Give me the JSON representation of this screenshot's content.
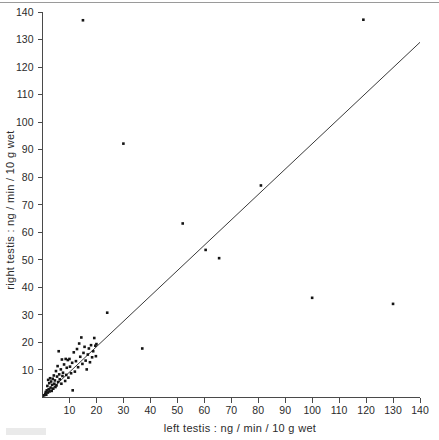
{
  "chart_data": {
    "type": "scatter",
    "title": "",
    "xlabel": "left testis : ng / min / 10 g wet",
    "ylabel": "right testis : ng / min / 10 g wet",
    "xlim": [
      0,
      140
    ],
    "ylim": [
      0,
      140
    ],
    "xticks": [
      10,
      20,
      30,
      40,
      50,
      60,
      70,
      80,
      90,
      100,
      110,
      120,
      130,
      140
    ],
    "yticks": [
      10,
      20,
      30,
      40,
      50,
      60,
      70,
      80,
      90,
      100,
      110,
      120,
      130,
      140
    ],
    "xtick_labels": [
      "10",
      "20",
      "30",
      "40",
      "50",
      "60",
      "70",
      "80",
      "90",
      "100",
      "110",
      "120",
      "130",
      "140"
    ],
    "ytick_labels": [
      "10",
      "20",
      "30",
      "40",
      "50",
      "60",
      "70",
      "80",
      "90",
      "100",
      "110",
      "120",
      "130",
      "140"
    ],
    "grid": false,
    "legend": null,
    "marker": "filled-square",
    "point_color": "#141414",
    "line_color": "#3a3a3a",
    "reference_line": {
      "label": "identity line",
      "x": [
        0,
        140
      ],
      "y": [
        0,
        129
      ]
    },
    "points": [
      [
        0.6,
        0.8
      ],
      [
        1.0,
        1.3
      ],
      [
        1.2,
        2.0
      ],
      [
        1.4,
        1.0
      ],
      [
        1.6,
        2.6
      ],
      [
        1.8,
        4.2
      ],
      [
        2.0,
        1.8
      ],
      [
        2.1,
        6.4
      ],
      [
        2.3,
        3.0
      ],
      [
        2.5,
        5.2
      ],
      [
        2.6,
        2.2
      ],
      [
        2.8,
        7.0
      ],
      [
        3.0,
        3.6
      ],
      [
        3.2,
        5.8
      ],
      [
        3.4,
        2.4
      ],
      [
        3.6,
        4.6
      ],
      [
        3.8,
        6.8
      ],
      [
        4.0,
        3.2
      ],
      [
        4.2,
        8.0
      ],
      [
        4.4,
        5.0
      ],
      [
        4.6,
        6.2
      ],
      [
        4.8,
        3.8
      ],
      [
        5.0,
        9.6
      ],
      [
        5.2,
        4.4
      ],
      [
        5.4,
        7.6
      ],
      [
        5.6,
        11.4
      ],
      [
        5.8,
        5.6
      ],
      [
        6.0,
        16.8
      ],
      [
        6.2,
        8.4
      ],
      [
        6.4,
        6.6
      ],
      [
        6.8,
        10.2
      ],
      [
        7.0,
        5.0
      ],
      [
        7.2,
        13.8
      ],
      [
        7.4,
        7.8
      ],
      [
        7.6,
        9.0
      ],
      [
        8.0,
        12.0
      ],
      [
        8.4,
        6.0
      ],
      [
        8.6,
        14.0
      ],
      [
        8.8,
        8.2
      ],
      [
        9.0,
        10.8
      ],
      [
        9.4,
        13.6
      ],
      [
        9.6,
        7.2
      ],
      [
        10.0,
        14.0
      ],
      [
        10.2,
        11.2
      ],
      [
        10.6,
        8.8
      ],
      [
        11.0,
        12.6
      ],
      [
        11.2,
        2.6
      ],
      [
        11.6,
        16.4
      ],
      [
        12.0,
        9.4
      ],
      [
        12.4,
        13.2
      ],
      [
        12.8,
        17.6
      ],
      [
        13.2,
        11.0
      ],
      [
        13.6,
        19.6
      ],
      [
        14.0,
        14.8
      ],
      [
        14.4,
        21.8
      ],
      [
        14.8,
        12.2
      ],
      [
        15.2,
        16.2
      ],
      [
        15.6,
        18.4
      ],
      [
        16.0,
        13.4
      ],
      [
        16.4,
        10.2
      ],
      [
        16.8,
        15.6
      ],
      [
        17.2,
        17.8
      ],
      [
        17.6,
        12.8
      ],
      [
        18.0,
        19.0
      ],
      [
        18.4,
        14.6
      ],
      [
        18.8,
        16.8
      ],
      [
        19.2,
        21.6
      ],
      [
        19.6,
        18.8
      ],
      [
        19.8,
        15.0
      ],
      [
        20.0,
        19.4
      ],
      [
        15.0,
        137.0
      ],
      [
        24.0,
        30.8
      ],
      [
        30.0,
        92.2
      ],
      [
        37.0,
        17.8
      ],
      [
        52.0,
        63.2
      ],
      [
        60.5,
        53.6
      ],
      [
        65.5,
        50.6
      ],
      [
        81.0,
        77.0
      ],
      [
        100.0,
        36.2
      ],
      [
        119.0,
        137.2
      ],
      [
        130.0,
        34.0
      ]
    ],
    "notable_points": [
      {
        "x": 15.0,
        "y": 137.0,
        "note": "outlier top-left"
      },
      {
        "x": 30.0,
        "y": 92.2,
        "note": "outlier above line"
      },
      {
        "x": 119.0,
        "y": 137.2,
        "note": "outlier top-right"
      },
      {
        "x": 100.0,
        "y": 36.2,
        "note": "outlier below line"
      },
      {
        "x": 130.0,
        "y": 34.0,
        "note": "outlier below line"
      }
    ]
  },
  "axes": {
    "x_axis_title": "left testis : ng / min / 10 g wet",
    "y_axis_title": "right testis : ng / min / 10 g wet"
  }
}
